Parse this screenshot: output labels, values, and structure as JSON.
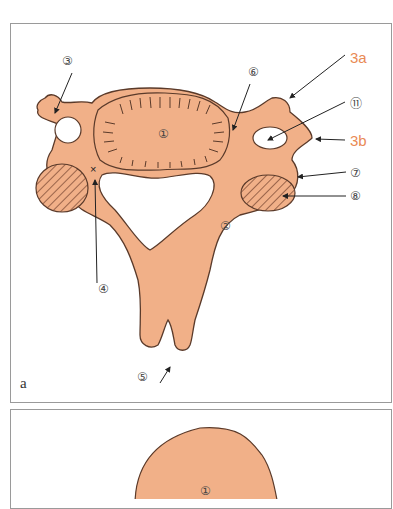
{
  "figure": {
    "panel_a": {
      "letter": "a",
      "labels": {
        "l1": "①",
        "l2": "②",
        "l3": "③",
        "l3a": "3a",
        "l3b": "3b",
        "l4": "④",
        "l5": "⑤",
        "l6": "⑥",
        "l7": "⑦",
        "l8": "⑧",
        "l11": "⑪"
      }
    },
    "panel_b": {
      "labels": {
        "l1": "①"
      }
    },
    "colors": {
      "bone_fill": "#f1b088",
      "outline": "#5a3a2a",
      "accent_label": "#e98a55",
      "frame": "#9a9a9a"
    }
  }
}
